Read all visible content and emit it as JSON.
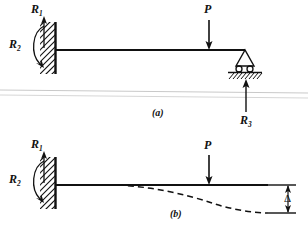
{
  "figure": {
    "title_note": "",
    "panels": [
      {
        "id": "a",
        "caption": "(a)",
        "labels": {
          "reaction_vertical": "R",
          "reaction_vertical_sub": "1",
          "reaction_moment": "R",
          "reaction_moment_sub": "2",
          "load": "P",
          "reaction_roller": "R",
          "reaction_roller_sub": "3"
        },
        "supports": [
          "fixed-wall",
          "roller"
        ],
        "description": "propped cantilever beam with point load"
      },
      {
        "id": "b",
        "caption": "(b)",
        "labels": {
          "reaction_vertical": "R",
          "reaction_vertical_sub": "1",
          "reaction_moment": "R",
          "reaction_moment_sub": "2",
          "load": "P",
          "deflection": "Δ"
        },
        "supports": [
          "fixed-wall"
        ],
        "description": "cantilever beam with point load and dashed deflected shape"
      }
    ]
  },
  "colors": {
    "ink": "#111111",
    "background": "#ffffff",
    "divider": "#c8c8c8"
  }
}
